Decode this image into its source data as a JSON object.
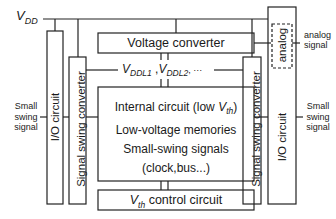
{
  "diagram": {
    "vdd_label": {
      "main": "V",
      "sub": "DD"
    },
    "vddl_label": {
      "v1": "V",
      "sub1": "DDL1",
      "sep": " ,",
      "v2": "V",
      "sub2": "DDL2",
      "tail": ", ···"
    },
    "voltage_converter": "Voltage converter",
    "internal_circuit": {
      "line1_prefix": "Internal circuit (low ",
      "line1_v": "V",
      "line1_sub": "th",
      "line1_suffix": ")",
      "line2": "Low-voltage memories",
      "line3": "Small-swing signals",
      "line4": "(clock,bus...)"
    },
    "vth_control": {
      "v": "V",
      "sub": "th",
      "text": " control circuit"
    },
    "left_io": "I/O circuit",
    "right_io": "I/O circuit",
    "left_converter": "Signal swing converter",
    "right_converter": "Signal swing converter",
    "analog_block": "analog",
    "analog_signal": "analog\nsignal",
    "analog_signal_l1": "analog",
    "analog_signal_l2": "signal",
    "left_signal": {
      "l1": "Small",
      "l2": "swing",
      "l3": "signal"
    },
    "right_signal": {
      "l1": "Small",
      "l2": "swing",
      "l3": "signal"
    }
  }
}
